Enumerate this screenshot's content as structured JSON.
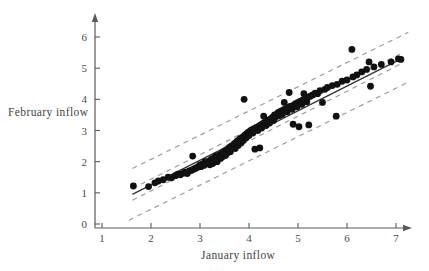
{
  "figure": {
    "ylabel": "February inflow",
    "xlabel": "January inflow"
  },
  "chart_data": {
    "type": "scatter",
    "title": "",
    "xlabel": "January inflow",
    "ylabel": "February inflow",
    "xlim": [
      0.55,
      7.35
    ],
    "ylim": [
      -0.35,
      6.45
    ],
    "xticks": [
      1,
      2,
      3,
      4,
      5,
      6,
      7
    ],
    "yticks": [
      0,
      1,
      2,
      3,
      4,
      5,
      6
    ],
    "grid": false,
    "legend": null,
    "marker": {
      "shape": "circle",
      "color": "#111111",
      "size": 3.4
    },
    "fit_line": {
      "name": "least-squares regression line",
      "style": "solid",
      "color": "#333333",
      "x": [
        1.62,
        7.1
      ],
      "y": [
        0.95,
        5.3
      ]
    },
    "bands": [
      {
        "name": "confidence band upper",
        "style": "dashed",
        "color": "#9a9a9a",
        "x": [
          1.62,
          7.1
        ],
        "y": [
          1.14,
          5.46
        ]
      },
      {
        "name": "confidence band lower",
        "style": "dashed",
        "color": "#9a9a9a",
        "x": [
          1.62,
          7.1
        ],
        "y": [
          0.76,
          5.14
        ]
      },
      {
        "name": "prediction band upper",
        "style": "dashed",
        "color": "#9a9a9a",
        "x": [
          1.62,
          7.25
        ],
        "y": [
          1.78,
          6.15
        ]
      },
      {
        "name": "prediction band lower",
        "style": "dashed",
        "color": "#9a9a9a",
        "x": [
          1.55,
          7.25
        ],
        "y": [
          0.12,
          4.55
        ]
      }
    ],
    "points": [
      [
        1.64,
        1.22
      ],
      [
        1.95,
        1.2
      ],
      [
        2.08,
        1.32
      ],
      [
        2.15,
        1.38
      ],
      [
        2.25,
        1.42
      ],
      [
        2.35,
        1.5
      ],
      [
        2.42,
        1.48
      ],
      [
        2.5,
        1.55
      ],
      [
        2.55,
        1.6
      ],
      [
        2.6,
        1.58
      ],
      [
        2.66,
        1.63
      ],
      [
        2.7,
        1.66
      ],
      [
        2.74,
        1.62
      ],
      [
        2.78,
        1.7
      ],
      [
        2.82,
        1.72
      ],
      [
        2.85,
        2.18
      ],
      [
        2.86,
        1.75
      ],
      [
        2.9,
        1.78
      ],
      [
        2.92,
        1.8
      ],
      [
        2.95,
        1.82
      ],
      [
        2.98,
        1.86
      ],
      [
        3.0,
        1.9
      ],
      [
        3.02,
        1.84
      ],
      [
        3.05,
        1.92
      ],
      [
        3.08,
        1.88
      ],
      [
        3.1,
        2.0
      ],
      [
        3.12,
        1.95
      ],
      [
        3.15,
        1.98
      ],
      [
        3.18,
        2.02
      ],
      [
        3.2,
        1.9
      ],
      [
        3.22,
        2.06
      ],
      [
        3.25,
        2.1
      ],
      [
        3.26,
        1.94
      ],
      [
        3.28,
        2.04
      ],
      [
        3.3,
        2.12
      ],
      [
        3.32,
        2.18
      ],
      [
        3.35,
        2.0
      ],
      [
        3.36,
        2.14
      ],
      [
        3.38,
        2.2
      ],
      [
        3.4,
        2.22
      ],
      [
        3.42,
        2.1
      ],
      [
        3.44,
        2.26
      ],
      [
        3.46,
        2.16
      ],
      [
        3.48,
        2.3
      ],
      [
        3.5,
        2.34
      ],
      [
        3.52,
        2.2
      ],
      [
        3.54,
        2.38
      ],
      [
        3.56,
        2.28
      ],
      [
        3.58,
        2.42
      ],
      [
        3.6,
        2.46
      ],
      [
        3.62,
        2.32
      ],
      [
        3.64,
        2.5
      ],
      [
        3.66,
        2.44
      ],
      [
        3.68,
        2.54
      ],
      [
        3.7,
        2.58
      ],
      [
        3.72,
        2.42
      ],
      [
        3.74,
        2.62
      ],
      [
        3.76,
        2.66
      ],
      [
        3.78,
        2.52
      ],
      [
        3.8,
        2.7
      ],
      [
        3.82,
        2.74
      ],
      [
        3.84,
        2.6
      ],
      [
        3.86,
        2.78
      ],
      [
        3.88,
        2.68
      ],
      [
        3.9,
        2.82
      ],
      [
        3.9,
        4.0
      ],
      [
        3.92,
        2.86
      ],
      [
        3.94,
        2.76
      ],
      [
        3.96,
        2.9
      ],
      [
        3.98,
        2.94
      ],
      [
        4.0,
        2.84
      ],
      [
        4.02,
        2.98
      ],
      [
        4.05,
        3.02
      ],
      [
        4.08,
        2.92
      ],
      [
        4.1,
        3.06
      ],
      [
        4.12,
        2.4
      ],
      [
        4.15,
        3.1
      ],
      [
        4.18,
        3.0
      ],
      [
        4.2,
        3.14
      ],
      [
        4.22,
        2.44
      ],
      [
        4.24,
        3.18
      ],
      [
        4.26,
        3.08
      ],
      [
        4.28,
        3.22
      ],
      [
        4.3,
        3.46
      ],
      [
        4.32,
        3.26
      ],
      [
        4.35,
        3.16
      ],
      [
        4.38,
        3.3
      ],
      [
        4.4,
        3.34
      ],
      [
        4.42,
        3.24
      ],
      [
        4.45,
        3.38
      ],
      [
        4.48,
        3.42
      ],
      [
        4.5,
        3.32
      ],
      [
        4.52,
        3.5
      ],
      [
        4.55,
        3.44
      ],
      [
        4.58,
        3.54
      ],
      [
        4.6,
        3.58
      ],
      [
        4.62,
        3.48
      ],
      [
        4.65,
        3.62
      ],
      [
        4.68,
        3.52
      ],
      [
        4.7,
        3.66
      ],
      [
        4.72,
        3.9
      ],
      [
        4.75,
        3.7
      ],
      [
        4.78,
        3.6
      ],
      [
        4.8,
        3.74
      ],
      [
        4.82,
        4.22
      ],
      [
        4.85,
        3.78
      ],
      [
        4.88,
        3.68
      ],
      [
        4.9,
        3.2
      ],
      [
        4.92,
        3.82
      ],
      [
        4.95,
        3.86
      ],
      [
        4.98,
        3.76
      ],
      [
        5.0,
        3.9
      ],
      [
        5.02,
        3.12
      ],
      [
        5.05,
        3.94
      ],
      [
        5.08,
        3.84
      ],
      [
        5.1,
        3.98
      ],
      [
        5.12,
        4.18
      ],
      [
        5.15,
        4.02
      ],
      [
        5.18,
        3.92
      ],
      [
        5.2,
        4.06
      ],
      [
        5.22,
        3.18
      ],
      [
        5.25,
        4.1
      ],
      [
        5.3,
        4.14
      ],
      [
        5.35,
        4.2
      ],
      [
        5.4,
        4.18
      ],
      [
        5.45,
        4.28
      ],
      [
        5.5,
        3.9
      ],
      [
        5.55,
        4.32
      ],
      [
        5.6,
        4.38
      ],
      [
        5.7,
        4.44
      ],
      [
        5.78,
        3.46
      ],
      [
        5.8,
        4.48
      ],
      [
        5.9,
        4.58
      ],
      [
        6.0,
        4.62
      ],
      [
        6.1,
        5.6
      ],
      [
        6.12,
        4.72
      ],
      [
        6.2,
        4.78
      ],
      [
        6.3,
        4.88
      ],
      [
        6.4,
        4.96
      ],
      [
        6.45,
        5.2
      ],
      [
        6.48,
        4.42
      ],
      [
        6.55,
        5.04
      ],
      [
        6.7,
        5.12
      ],
      [
        6.9,
        5.2
      ],
      [
        7.05,
        5.3
      ],
      [
        7.1,
        5.28
      ]
    ]
  },
  "colors": {
    "axis": "#5a5a5a",
    "point": "#111111",
    "fit_line": "#333333",
    "band": "#9a9a9a",
    "text": "#444444"
  }
}
